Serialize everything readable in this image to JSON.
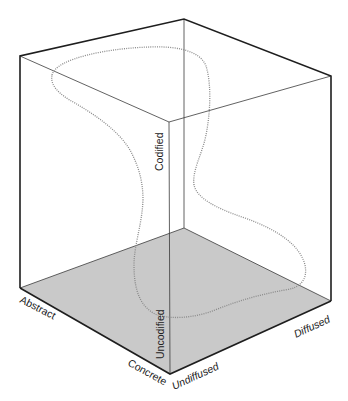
{
  "diagram": {
    "type": "3d-cube-information-space",
    "colors": {
      "floor": "#c9c9c9",
      "outer_edge": "#1e1e1e",
      "inner_edge": "#3a3a3a",
      "curve": "#8a8a8a",
      "text": "#222222"
    },
    "axes": {
      "codification": {
        "high_label": "Codified",
        "low_label": "Uncodified"
      },
      "abstraction": {
        "high_label": "Abstract",
        "low_label": "Concrete"
      },
      "diffusion": {
        "low_label": "Undiffused",
        "high_label": "Diffused"
      }
    },
    "vertices": {
      "top_left": [
        20,
        56
      ],
      "top_back": [
        184,
        19
      ],
      "top_right": [
        331,
        76
      ],
      "top_front": [
        169,
        122
      ],
      "bottom_left": [
        20,
        288
      ],
      "bottom_back": [
        184,
        228
      ],
      "bottom_right": [
        331,
        301
      ],
      "bottom_front": [
        170,
        374
      ]
    },
    "curve_description": "Dotted closed loop tracing a path through the information space"
  }
}
